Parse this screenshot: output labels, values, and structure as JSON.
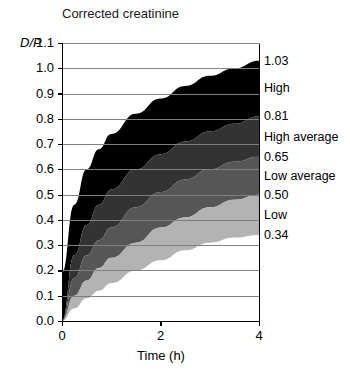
{
  "chart_data": {
    "type": "area",
    "title": "Corrected creatinine",
    "xlabel": "Time (h)",
    "ylabel": "D/P",
    "xlim": [
      0,
      4
    ],
    "ylim": [
      0.0,
      1.1
    ],
    "grid": true,
    "legend_position": "right-of-axes",
    "xticks": [
      "0",
      "2",
      "4"
    ],
    "xtick_values": [
      0,
      2,
      4
    ],
    "yticks": [
      "0.0",
      "0.1",
      "0.2",
      "0.3",
      "0.4",
      "0.5",
      "0.6",
      "0.7",
      "0.8",
      "0.9",
      "1.0",
      "1.1"
    ],
    "ytick_values": [
      0.0,
      0.1,
      0.2,
      0.3,
      0.4,
      0.5,
      0.6,
      0.7,
      0.8,
      0.9,
      1.0,
      1.1
    ],
    "x": [
      0,
      0.25,
      0.5,
      0.75,
      1,
      1.5,
      2,
      2.5,
      3,
      3.5,
      4
    ],
    "series": [
      {
        "name": "High",
        "endpoint_label": "1.03",
        "color": "#000000",
        "values": [
          0.19,
          0.46,
          0.6,
          0.68,
          0.74,
          0.82,
          0.88,
          0.93,
          0.97,
          1.0,
          1.03
        ]
      },
      {
        "name": "High average",
        "endpoint_label": "0.81",
        "color": "#333333",
        "values": [
          0.0,
          0.26,
          0.38,
          0.46,
          0.52,
          0.6,
          0.66,
          0.71,
          0.75,
          0.78,
          0.81
        ]
      },
      {
        "name": "Low average",
        "endpoint_label": "0.65",
        "color": "#565656",
        "values": [
          0.0,
          0.17,
          0.26,
          0.32,
          0.37,
          0.45,
          0.51,
          0.56,
          0.6,
          0.63,
          0.65
        ]
      },
      {
        "name": "Low",
        "endpoint_label": "0.50",
        "color": "#b3b3b3",
        "values": [
          0.0,
          0.1,
          0.16,
          0.21,
          0.25,
          0.31,
          0.37,
          0.41,
          0.45,
          0.48,
          0.5
        ]
      },
      {
        "name": "baseline",
        "endpoint_label": "0.34",
        "color": "#ffffff",
        "values": [
          0.0,
          0.05,
          0.09,
          0.12,
          0.15,
          0.2,
          0.24,
          0.28,
          0.31,
          0.33,
          0.34
        ]
      }
    ],
    "right_labels": [
      {
        "text": "1.03",
        "value": 1.03,
        "kind": "value"
      },
      {
        "text": "High",
        "value": 0.92,
        "kind": "name"
      },
      {
        "text": "0.81",
        "value": 0.81,
        "kind": "value"
      },
      {
        "text": "High average",
        "value": 0.73,
        "kind": "name"
      },
      {
        "text": "0.65",
        "value": 0.65,
        "kind": "value"
      },
      {
        "text": "Low average",
        "value": 0.575,
        "kind": "name"
      },
      {
        "text": "0.50",
        "value": 0.5,
        "kind": "value"
      },
      {
        "text": "Low",
        "value": 0.42,
        "kind": "name"
      },
      {
        "text": "0.34",
        "value": 0.34,
        "kind": "value"
      }
    ],
    "colors": {
      "band_high": "#000000",
      "band_high_average": "#333333",
      "band_low_average": "#565656",
      "band_low": "#b3b3b3",
      "grid": "#808080",
      "axis": "#000000",
      "background": "#ffffff"
    }
  }
}
